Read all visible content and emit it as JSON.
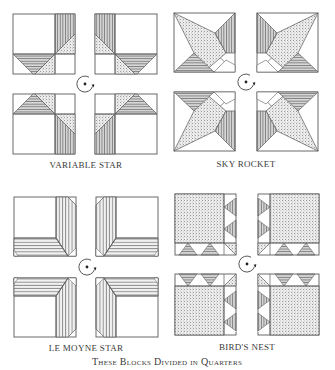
{
  "figure": {
    "caption": "These Blocks Divided in Quarters",
    "rotation_icon": "rotate-clockwise-icon",
    "colors": {
      "line": "#5a5a5a",
      "fill_stipple": "#e3e3e3",
      "text": "#3a3a3a",
      "background": "#ffffff"
    }
  },
  "blocks": [
    {
      "id": "variable-star",
      "label": "VARIABLE STAR"
    },
    {
      "id": "sky-rocket",
      "label": "SKY ROCKET"
    },
    {
      "id": "le-moyne-star",
      "label": "LE MOYNE STAR"
    },
    {
      "id": "birds-nest",
      "label": "BIRD'S NEST"
    }
  ]
}
